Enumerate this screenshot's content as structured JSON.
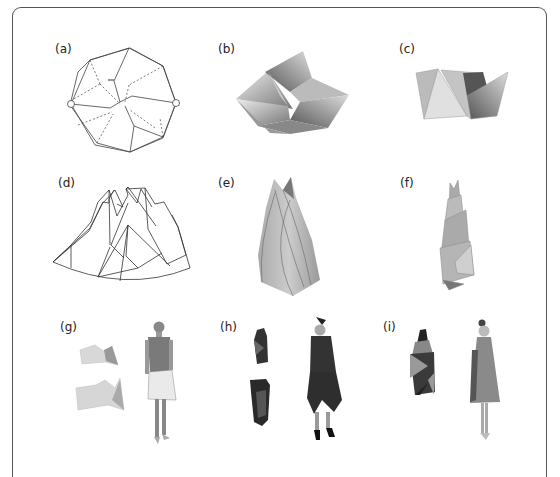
{
  "figure": {
    "panels": [
      {
        "id": "a",
        "label": "(a)",
        "content": "octagonal crease pattern with two hinge circles"
      },
      {
        "id": "b",
        "label": "(b)",
        "content": "folded twisted origami form (top view)"
      },
      {
        "id": "c",
        "label": "(c)",
        "content": "folded origami form (side view)"
      },
      {
        "id": "d",
        "label": "(d)",
        "content": "fan-shaped crease pattern"
      },
      {
        "id": "e",
        "label": "(e)",
        "content": "folded conical spiral form"
      },
      {
        "id": "f",
        "label": "(f)",
        "content": "folded stepped tower form"
      },
      {
        "id": "g",
        "label": "(g)",
        "content": "garment pieces and dressed mannequin"
      },
      {
        "id": "h",
        "label": "(h)",
        "content": "dark garment pieces and dressed mannequin"
      },
      {
        "id": "i",
        "label": "(i)",
        "content": "spiral garment piece and dressed mannequin"
      }
    ]
  }
}
